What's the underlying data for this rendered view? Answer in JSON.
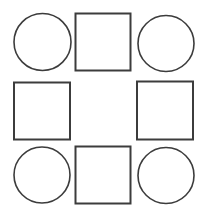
{
  "figure": {
    "background_color": "#ffffff",
    "stroke_color": "#3c3c3c",
    "fill_color": "#ffffff",
    "canvas": {
      "width": 206,
      "height": 216
    },
    "grid": {
      "rows": 3,
      "columns": 3,
      "center_cell": "empty"
    },
    "shape_counts": {
      "circles": 4,
      "squares": 4,
      "empty_cells": 1,
      "total_shapes": 8
    },
    "shapes": [
      {
        "id": "circle-top-left",
        "type": "circle",
        "cell": "row-1-col-1",
        "cx": 42.5,
        "cy": 42.0,
        "r": 28.5,
        "stroke_width": 1.6
      },
      {
        "id": "square-top-center",
        "type": "square",
        "cell": "row-1-col-2",
        "x": 75.5,
        "y": 13.5,
        "width": 55,
        "height": 57,
        "stroke_width": 2
      },
      {
        "id": "circle-top-right",
        "type": "circle",
        "cell": "row-1-col-3",
        "cx": 166.0,
        "cy": 43.5,
        "r": 28.0,
        "stroke_width": 1.6
      },
      {
        "id": "square-middle-left",
        "type": "square",
        "cell": "row-2-col-1",
        "x": 14.0,
        "y": 82.5,
        "width": 56,
        "height": 57,
        "stroke_width": 2
      },
      {
        "id": "empty-center",
        "type": "empty",
        "cell": "row-2-col-2",
        "x": 75.5,
        "y": 82.5,
        "width": 55,
        "height": 57
      },
      {
        "id": "square-middle-right",
        "type": "square",
        "cell": "row-2-col-3",
        "x": 137.0,
        "y": 81.5,
        "width": 56,
        "height": 58,
        "stroke_width": 2
      },
      {
        "id": "circle-bottom-left",
        "type": "circle",
        "cell": "row-3-col-1",
        "cx": 42.0,
        "cy": 175.0,
        "r": 28.0,
        "stroke_width": 1.6
      },
      {
        "id": "square-bottom-center",
        "type": "square",
        "cell": "row-3-col-2",
        "x": 75.5,
        "y": 146.5,
        "width": 55,
        "height": 57,
        "stroke_width": 2
      },
      {
        "id": "circle-bottom-right",
        "type": "circle",
        "cell": "row-3-col-3",
        "cx": 166.0,
        "cy": 175.5,
        "r": 28.0,
        "stroke_width": 1.6
      }
    ]
  }
}
